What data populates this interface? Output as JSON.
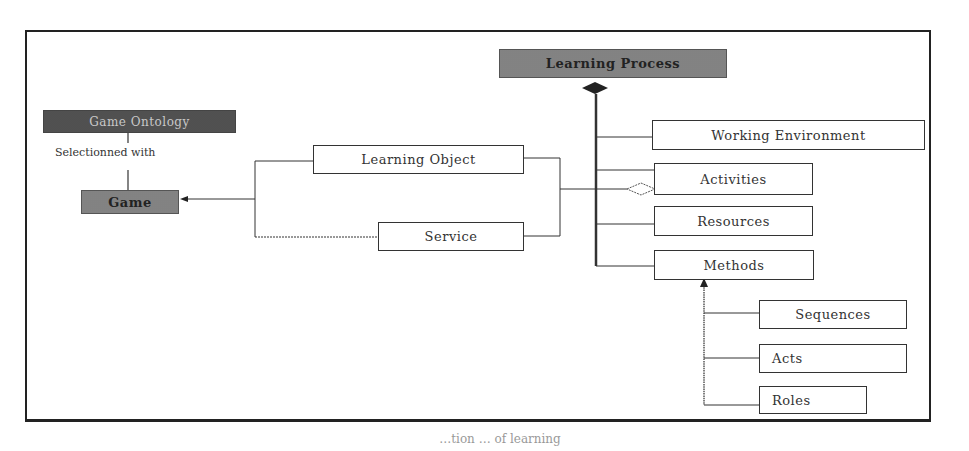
{
  "diagram": {
    "nodes": {
      "game_ontology": "Game Ontology",
      "game": "Game",
      "learning_object": "Learning Object",
      "service": "Service",
      "learning_process": "Learning Process",
      "working_environment": "Working Environment",
      "activities": "Activities",
      "resources": "Resources",
      "methods": "Methods",
      "sequences": "Sequences",
      "acts": "Acts",
      "roles": "Roles"
    },
    "edge_labels": {
      "selection": "Selectionned with"
    },
    "caption": "…tion … of learning"
  }
}
